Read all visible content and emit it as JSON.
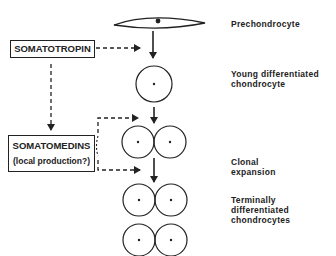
{
  "diagram": {
    "stages": [
      {
        "id": "prechondrocyte",
        "label_lines": [
          "Prechondrocyte"
        ]
      },
      {
        "id": "young",
        "label_lines": [
          "Young differentiated",
          "chondrocyte"
        ]
      },
      {
        "id": "clonal",
        "label_lines": [
          "Clonal",
          "expansion"
        ]
      },
      {
        "id": "terminal",
        "label_lines": [
          "Terminally",
          "differentiated",
          "chondrocytes"
        ]
      }
    ],
    "factors": {
      "somatotropin": {
        "label": "SOMATOTROPIN"
      },
      "somatomedins": {
        "label": "SOMATOMEDINS",
        "sublabel": "(local production?)"
      }
    },
    "colors": {
      "ink": "#222222",
      "background": "#ffffff"
    }
  }
}
